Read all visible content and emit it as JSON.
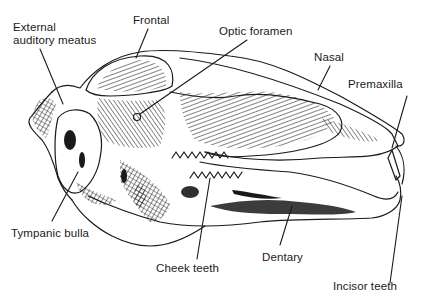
{
  "diagram": {
    "ink_color": "#1a1a1a",
    "background_color": "#ffffff",
    "labels": [
      {
        "id": "external-auditory-meatus",
        "text": "External\nauditory meatus",
        "x": 13,
        "y": 21
      },
      {
        "id": "frontal",
        "text": "Frontal",
        "x": 133,
        "y": 14
      },
      {
        "id": "optic-foramen",
        "text": "Optic foramen",
        "x": 219,
        "y": 25
      },
      {
        "id": "nasal",
        "text": "Nasal",
        "x": 314,
        "y": 51
      },
      {
        "id": "premaxilla",
        "text": "Premaxilla",
        "x": 348,
        "y": 78
      },
      {
        "id": "tympanic-bulla",
        "text": "Tympanic bulla",
        "x": 11,
        "y": 227
      },
      {
        "id": "cheek-teeth",
        "text": "Cheek teeth",
        "x": 156,
        "y": 262
      },
      {
        "id": "dentary",
        "text": "Dentary",
        "x": 262,
        "y": 251
      },
      {
        "id": "incisor-teeth",
        "text": "Incisor teeth",
        "x": 333,
        "y": 280
      }
    ]
  }
}
